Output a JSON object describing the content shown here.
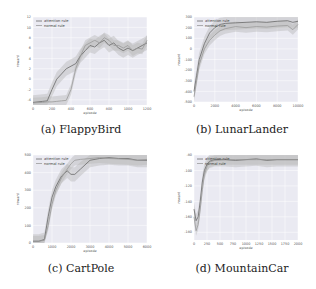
{
  "figure": {
    "captions": [
      "(a) FlappyBird",
      "(b) LunarLander",
      "(c) CartPole",
      "(d) MountainCar"
    ]
  },
  "colors": {
    "plot_bg": "#eaeaf2",
    "grid": "#ffffff",
    "attention_line": "#6a6a6a",
    "normal_line": "#9a9a9a",
    "band": "#b9b9b9"
  },
  "chart_data": [
    {
      "type": "line",
      "title": "(a) FlappyBird",
      "xlabel": "episode",
      "ylabel": "reward",
      "xlim": [
        0,
        1200
      ],
      "ylim": [
        -5,
        12
      ],
      "xticks": [
        0,
        200,
        400,
        600,
        800,
        1000,
        1200
      ],
      "yticks": [
        -4,
        -2,
        0,
        2,
        4,
        6,
        8,
        10,
        12
      ],
      "grid": true,
      "legend": {
        "position": "upper left",
        "entries": [
          "attention rule",
          "normal rule"
        ]
      },
      "series": [
        {
          "name": "attention rule",
          "x": [
            0,
            100,
            150,
            200,
            250,
            300,
            350,
            400,
            450,
            500,
            550,
            600,
            650,
            700,
            750,
            800,
            850,
            900,
            950,
            1000,
            1050,
            1100,
            1150,
            1200
          ],
          "y": [
            -4.5,
            -4.3,
            -4.2,
            -2,
            0,
            1.0,
            2,
            2.5,
            3,
            4.5,
            5.5,
            6.5,
            6.2,
            7,
            7.5,
            6.5,
            7,
            6,
            5.5,
            6,
            5.5,
            6,
            6.5,
            7
          ]
        },
        {
          "name": "normal rule",
          "x": [
            0,
            100,
            150,
            200,
            250,
            300,
            350,
            400,
            450,
            500,
            550,
            600,
            650,
            700,
            750,
            800,
            850,
            900,
            950,
            1000,
            1050,
            1100,
            1150,
            1200
          ],
          "y": [
            -4.6,
            -4.5,
            -4.4,
            -4.4,
            -4.3,
            -4.2,
            -4.1,
            -2,
            2,
            4.5,
            6.5,
            7,
            7.5,
            7,
            8,
            7.5,
            6.5,
            6.5,
            6,
            6.5,
            5.5,
            6,
            5.8,
            7.5
          ]
        }
      ]
    },
    {
      "type": "line",
      "title": "(b) LunarLander",
      "xlabel": "episode",
      "ylabel": "reward",
      "xlim": [
        0,
        10000
      ],
      "ylim": [
        -500,
        300
      ],
      "xticks": [
        0,
        2000,
        4000,
        6000,
        8000,
        10000
      ],
      "yticks": [
        -500,
        -400,
        -300,
        -200,
        -100,
        0,
        100,
        200,
        300
      ],
      "grid": true,
      "legend": {
        "position": "upper left",
        "entries": [
          "attention rule",
          "normal rule"
        ]
      },
      "series": [
        {
          "name": "attention rule",
          "x": [
            0,
            250,
            500,
            1000,
            1500,
            2000,
            2500,
            3000,
            4000,
            5000,
            6000,
            7000,
            8000,
            9000,
            9500,
            10000
          ],
          "y": [
            -400,
            -250,
            -100,
            50,
            150,
            200,
            230,
            240,
            245,
            250,
            255,
            250,
            260,
            265,
            250,
            260
          ]
        },
        {
          "name": "normal rule",
          "x": [
            0,
            250,
            500,
            1000,
            1500,
            2000,
            2500,
            3000,
            4000,
            5000,
            6000,
            7000,
            8000,
            9000,
            9500,
            10000
          ],
          "y": [
            -450,
            -300,
            -150,
            0,
            80,
            130,
            170,
            190,
            210,
            200,
            210,
            205,
            215,
            220,
            180,
            230
          ]
        }
      ]
    },
    {
      "type": "line",
      "title": "(c) CartPole",
      "xlabel": "episode",
      "ylabel": "reward",
      "xlim": [
        0,
        6000
      ],
      "ylim": [
        0,
        500
      ],
      "xticks": [
        0,
        1000,
        2000,
        3000,
        4000,
        5000,
        6000
      ],
      "yticks": [
        0,
        100,
        200,
        300,
        400,
        500
      ],
      "grid": true,
      "legend": {
        "position": "upper left",
        "entries": [
          "attention rule",
          "normal rule"
        ]
      },
      "series": [
        {
          "name": "attention rule",
          "x": [
            0,
            300,
            600,
            800,
            1000,
            1200,
            1500,
            1800,
            2000,
            2200,
            2500,
            3000,
            3500,
            4000,
            4500,
            5000,
            5500,
            6000
          ],
          "y": [
            10,
            10,
            20,
            150,
            260,
            320,
            380,
            410,
            390,
            390,
            420,
            470,
            480,
            485,
            480,
            480,
            470,
            470
          ]
        },
        {
          "name": "normal rule",
          "x": [
            0,
            300,
            600,
            800,
            1000,
            1200,
            1500,
            1800,
            2000,
            2200,
            2500,
            3000,
            3500,
            4000,
            4500,
            5000,
            5500,
            6000
          ],
          "y": [
            10,
            10,
            15,
            100,
            220,
            300,
            370,
            420,
            450,
            470,
            475,
            480,
            485,
            480,
            478,
            475,
            470,
            475
          ]
        }
      ]
    },
    {
      "type": "line",
      "title": "(d) MountainCar",
      "xlabel": "episode",
      "ylabel": "reward",
      "xlim": [
        0,
        2000
      ],
      "ylim": [
        -190,
        -80
      ],
      "xticks": [
        0,
        250,
        500,
        750,
        1000,
        1250,
        1500,
        1750,
        2000
      ],
      "yticks": [
        -180,
        -160,
        -140,
        -120,
        -100,
        -80
      ],
      "grid": true,
      "legend": {
        "position": "upper left",
        "entries": [
          "attention rule",
          "normal rule"
        ]
      },
      "series": [
        {
          "name": "attention rule",
          "x": [
            0,
            40,
            80,
            120,
            160,
            200,
            250,
            300,
            400,
            600,
            800,
            1000,
            1200,
            1400,
            1600,
            1800,
            2000
          ],
          "y": [
            -150,
            -165,
            -160,
            -140,
            -115,
            -100,
            -92,
            -88,
            -86,
            -86,
            -87,
            -86,
            -85,
            -87,
            -86,
            -86,
            -86
          ]
        },
        {
          "name": "normal rule",
          "x": [
            0,
            40,
            80,
            120,
            160,
            200,
            250,
            300,
            400,
            600,
            800,
            1000,
            1200,
            1400,
            1600,
            1800,
            2000
          ],
          "y": [
            -160,
            -178,
            -170,
            -150,
            -125,
            -105,
            -95,
            -89,
            -87,
            -86,
            -86,
            -86,
            -86,
            -86,
            -86,
            -86,
            -86
          ]
        }
      ]
    }
  ]
}
